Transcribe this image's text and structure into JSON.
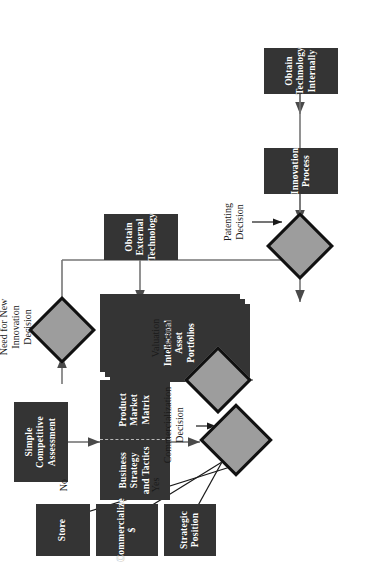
{
  "diagram": {
    "type": "flowchart",
    "orientation": "rotated-90-ccw",
    "colors": {
      "node_fill": "#343434",
      "node_text": "#ffffff",
      "decision_fill": "#9d9d9d",
      "decision_border": "#111111",
      "edge": "#6e6e6e",
      "label_text": "#1a1a1a",
      "background": "#ffffff"
    },
    "nodes": [
      {
        "id": "simple_competitive",
        "kind": "process",
        "text": "Simple\nCompetitive\nAssessment"
      },
      {
        "id": "business_strategy",
        "kind": "process-split-left",
        "text": "Business\nStrategy\nand Tactics"
      },
      {
        "id": "product_market",
        "kind": "process-split-right",
        "text": "Product\nMarket\nMatrix"
      },
      {
        "id": "strategic_position",
        "kind": "process",
        "text": "Strategic\nPosition"
      },
      {
        "id": "commercialize",
        "kind": "process",
        "text": "Commercialize\n$"
      },
      {
        "id": "store",
        "kind": "process",
        "text": "Store"
      },
      {
        "id": "intellectual_assets",
        "kind": "document-stack",
        "text": "Intellectual\nAsset\nPortfolios"
      },
      {
        "id": "obtain_external",
        "kind": "process",
        "text": "Obtain\nExternal\nTechnology"
      },
      {
        "id": "obtain_internal",
        "kind": "process",
        "text": "Obtain\nTechnology\nInternally"
      },
      {
        "id": "innovation_process",
        "kind": "process",
        "text": "Innovation\nProcess"
      }
    ],
    "decisions": [
      {
        "id": "valuation",
        "label": "Valuation\nDecision"
      },
      {
        "id": "patenting",
        "label": "Patenting\nDecision"
      },
      {
        "id": "commercialization",
        "label": "Commercialization\nDecision"
      },
      {
        "id": "need_new_innovation",
        "label": "Need for New\nInnovation\nDecision"
      }
    ],
    "edge_labels": [
      {
        "id": "yes",
        "text": "Yes"
      },
      {
        "id": "no",
        "text": "No"
      }
    ],
    "edges": [
      {
        "from": "innovation_process",
        "to": "patenting"
      },
      {
        "from": "patenting",
        "to": "intellectual_assets"
      },
      {
        "from": "intellectual_assets",
        "to": "valuation"
      },
      {
        "from": "valuation",
        "to": "business_strategy"
      },
      {
        "from": "simple_competitive",
        "to": "business_strategy"
      },
      {
        "from": "product_market",
        "to": "commercialization"
      },
      {
        "from": "commercialization",
        "to": "strategic_position",
        "label": "Yes"
      },
      {
        "from": "commercialization",
        "to": "commercialize",
        "label": "Yes"
      },
      {
        "from": "commercialization",
        "to": "store",
        "label": "No"
      },
      {
        "from": "store",
        "to": "need_new_innovation"
      },
      {
        "from": "need_new_innovation",
        "to": "obtain_external"
      },
      {
        "from": "need_new_innovation",
        "to": "obtain_internal"
      },
      {
        "from": "obtain_external",
        "to": "intellectual_assets"
      },
      {
        "from": "obtain_internal",
        "to": "innovation_process"
      }
    ]
  }
}
